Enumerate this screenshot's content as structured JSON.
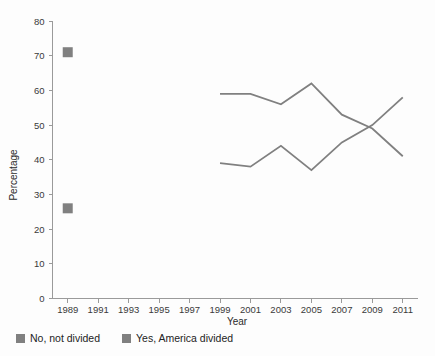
{
  "chart_data": {
    "type": "line",
    "title": "",
    "xlabel": "Year",
    "ylabel": "Percentage",
    "xlim": [
      1988,
      2012
    ],
    "ylim": [
      0,
      80
    ],
    "grid": false,
    "legend_position": "bottom-left",
    "x_tick_labels": [
      "1989",
      "1991",
      "1993",
      "1995",
      "1997",
      "1999",
      "2001",
      "2003",
      "2005",
      "2007",
      "2009",
      "2011"
    ],
    "x_ticks": [
      1989,
      1991,
      1993,
      1995,
      1997,
      1999,
      2001,
      2003,
      2005,
      2007,
      2009,
      2011
    ],
    "y_tick_labels": [
      "0",
      "10",
      "20",
      "30",
      "40",
      "50",
      "60",
      "70",
      "80"
    ],
    "y_ticks": [
      0,
      10,
      20,
      30,
      40,
      50,
      60,
      70,
      80
    ],
    "series": [
      {
        "name": "No, not divided",
        "color": "#808080",
        "marker_points": [
          {
            "x": 1989,
            "y": 71
          }
        ],
        "x": [
          1999,
          2001,
          2003,
          2005,
          2007,
          2009,
          2011
        ],
        "values": [
          59,
          59,
          56,
          62,
          53,
          49,
          41
        ]
      },
      {
        "name": "Yes, America divided",
        "color": "#808080",
        "marker_points": [
          {
            "x": 1989,
            "y": 26
          }
        ],
        "x": [
          1999,
          2001,
          2003,
          2005,
          2007,
          2009,
          2011
        ],
        "values": [
          39,
          38,
          44,
          37,
          45,
          50,
          58
        ]
      }
    ]
  },
  "legend": {
    "items": [
      {
        "label": "No, not divided",
        "color": "#808080"
      },
      {
        "label": "Yes, America divided",
        "color": "#808080"
      }
    ]
  },
  "axes": {
    "y_title": "Percentage",
    "x_title": "Year"
  }
}
